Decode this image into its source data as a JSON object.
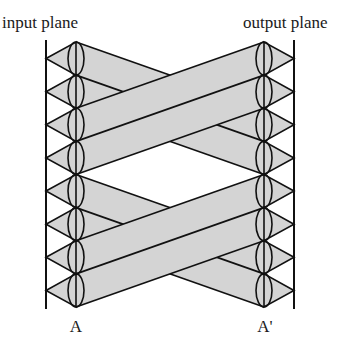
{
  "diagram": {
    "type": "optical-interconnect",
    "labels": {
      "input_plane": "input plane",
      "output_plane": "output plane",
      "input_point": "A",
      "output_point": "A'"
    },
    "colors": {
      "stroke": "#111111",
      "beam_fill": "#d4d4d4",
      "background": "#ffffff"
    },
    "geometry": {
      "input_plane_x": 46,
      "output_plane_x": 294,
      "input_lens_x": 76,
      "output_lens_x": 264,
      "top_y": 42,
      "bottom_y": 307,
      "lens_count": 8,
      "lens_half_width": 8
    },
    "connections": [
      {
        "from": [
          0,
          1
        ],
        "to": [
          2,
          3
        ]
      },
      {
        "from": [
          2,
          3
        ],
        "to": [
          0,
          1
        ]
      },
      {
        "from": [
          4,
          5
        ],
        "to": [
          6,
          7
        ]
      },
      {
        "from": [
          6,
          7
        ],
        "to": [
          4,
          5
        ]
      }
    ]
  }
}
